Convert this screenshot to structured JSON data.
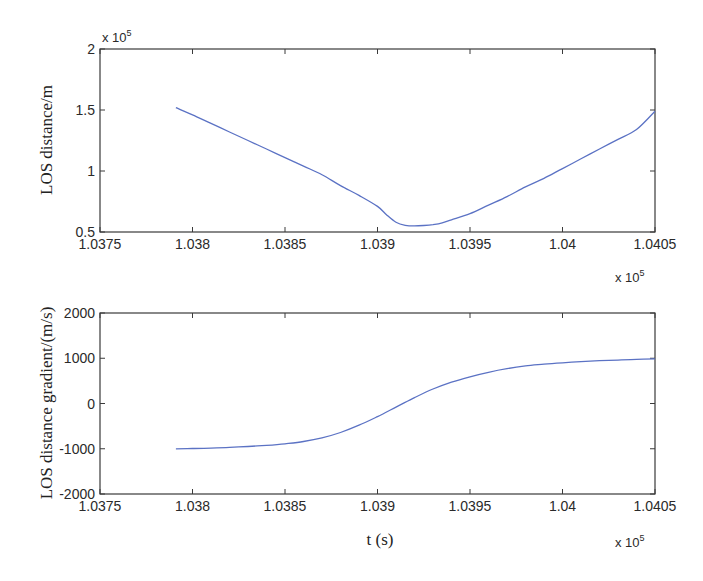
{
  "chart_data": [
    {
      "type": "line",
      "title": "",
      "xlabel": "",
      "ylabel": "LOS distance/m",
      "x_multiplier_label": "x 10",
      "x_multiplier_exp": "5",
      "y_multiplier_label": "x 10",
      "y_multiplier_exp": "5",
      "xlim": [
        1.0375,
        1.0405
      ],
      "ylim": [
        0.5,
        2.0
      ],
      "xticks": [
        "1.0375",
        "1.038",
        "1.0385",
        "1.039",
        "1.0395",
        "1.04",
        "1.0405"
      ],
      "xtick_values": [
        1.0375,
        1.038,
        1.0385,
        1.039,
        1.0395,
        1.04,
        1.0405
      ],
      "yticks": [
        "0.5",
        "1",
        "1.5",
        "2"
      ],
      "ytick_values": [
        0.5,
        1.0,
        1.5,
        2.0
      ],
      "grid": false,
      "legend": null,
      "series": [
        {
          "name": "LOS distance",
          "color": "#5b72c4",
          "x": [
            1.03791,
            1.038,
            1.0381,
            1.0382,
            1.0383,
            1.0384,
            1.0385,
            1.0386,
            1.0387,
            1.0388,
            1.0389,
            1.039,
            1.03905,
            1.0391,
            1.03915,
            1.0392,
            1.03925,
            1.0393,
            1.03935,
            1.0394,
            1.0395,
            1.0396,
            1.0397,
            1.0398,
            1.0399,
            1.04,
            1.0401,
            1.0402,
            1.0403,
            1.0404,
            1.0405
          ],
          "y": [
            1.52,
            1.46,
            1.39,
            1.32,
            1.25,
            1.18,
            1.11,
            1.04,
            0.97,
            0.88,
            0.8,
            0.71,
            0.64,
            0.58,
            0.555,
            0.55,
            0.553,
            0.56,
            0.575,
            0.6,
            0.65,
            0.72,
            0.79,
            0.87,
            0.94,
            1.02,
            1.1,
            1.18,
            1.26,
            1.34,
            1.49
          ]
        }
      ]
    },
    {
      "type": "line",
      "title": "",
      "xlabel": "t (s)",
      "ylabel": "LOS distance gradient/(m/s)",
      "x_multiplier_label": "x 10",
      "x_multiplier_exp": "5",
      "xlim": [
        1.0375,
        1.0405
      ],
      "ylim": [
        -2000,
        2000
      ],
      "xticks": [
        "1.0375",
        "1.038",
        "1.0385",
        "1.039",
        "1.0395",
        "1.04",
        "1.0405"
      ],
      "xtick_values": [
        1.0375,
        1.038,
        1.0385,
        1.039,
        1.0395,
        1.04,
        1.0405
      ],
      "yticks": [
        "-2000",
        "-1000",
        "0",
        "1000",
        "2000"
      ],
      "ytick_values": [
        -2000,
        -1000,
        0,
        1000,
        2000
      ],
      "grid": false,
      "legend": null,
      "series": [
        {
          "name": "LOS distance gradient",
          "color": "#5b72c4",
          "x": [
            1.03791,
            1.038,
            1.0381,
            1.0382,
            1.0383,
            1.0384,
            1.0385,
            1.0386,
            1.0387,
            1.0388,
            1.0389,
            1.039,
            1.0391,
            1.0392,
            1.0393,
            1.0394,
            1.0395,
            1.0396,
            1.0397,
            1.0398,
            1.0399,
            1.04,
            1.0401,
            1.0402,
            1.0403,
            1.0404,
            1.0405
          ],
          "y": [
            -1000,
            -995,
            -985,
            -970,
            -950,
            -925,
            -890,
            -840,
            -760,
            -640,
            -480,
            -290,
            -80,
            130,
            320,
            470,
            590,
            690,
            770,
            830,
            870,
            900,
            925,
            945,
            960,
            975,
            985
          ]
        }
      ]
    }
  ]
}
